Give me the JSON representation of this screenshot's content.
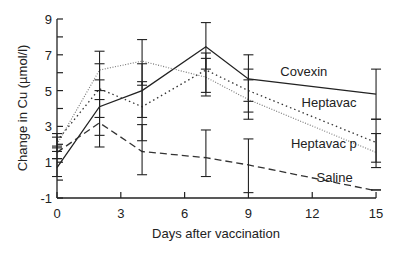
{
  "chart_data": {
    "type": "line",
    "title": "",
    "xlabel": "Days after vaccination",
    "ylabel": "Change in Cu (µmol/l)",
    "xlim": [
      0,
      15
    ],
    "ylim": [
      -1,
      9
    ],
    "xticks": [
      0,
      3,
      6,
      9,
      12,
      15
    ],
    "yticks": [
      -1,
      1,
      3,
      5,
      7,
      9
    ],
    "grid": false,
    "legend": "inline labels",
    "x": [
      0,
      2,
      4,
      7,
      9,
      15
    ],
    "series": [
      {
        "name": "Covexin",
        "style": "solid",
        "values": [
          0.7,
          4.1,
          5.0,
          7.45,
          5.65,
          4.8
        ],
        "err": [
          [
            0.2,
            1.2
          ],
          [
            2.5,
            5.6
          ],
          [
            3.5,
            6.5
          ],
          [
            6.2,
            8.8
          ],
          [
            4.4,
            7.0
          ],
          [
            3.4,
            6.2
          ]
        ],
        "label_pos": [
          10.5,
          5.8
        ]
      },
      {
        "name": "Heptavac",
        "style": "dotted",
        "values": [
          2.2,
          5.1,
          4.1,
          6.15,
          5.0,
          2.1
        ],
        "err": [
          [
            1.8,
            2.6
          ],
          [
            3.5,
            6.5
          ],
          [
            2.2,
            5.5
          ],
          [
            4.9,
            7.1
          ],
          [
            3.8,
            6.2
          ],
          [
            1.0,
            3.4
          ]
        ],
        "label_pos": [
          11.5,
          4.1
        ]
      },
      {
        "name": "Heptavac p",
        "style": "fine-dotted",
        "values": [
          2.0,
          6.15,
          6.65,
          5.75,
          4.5,
          1.55
        ],
        "err": [
          [
            1.6,
            2.4
          ],
          [
            5.0,
            7.2
          ],
          [
            5.3,
            7.85
          ],
          [
            4.7,
            6.8
          ],
          [
            3.4,
            5.6
          ],
          [
            0.7,
            2.6
          ]
        ],
        "label_pos": [
          11.0,
          1.8
        ]
      },
      {
        "name": "Saline",
        "style": "dashed",
        "values": [
          1.55,
          3.2,
          1.6,
          1.25,
          0.85,
          -0.6
        ],
        "err": [
          [
            1.2,
            1.9
          ],
          [
            1.85,
            4.5
          ],
          [
            0.3,
            3.1
          ],
          [
            0.2,
            2.8
          ],
          [
            -0.7,
            2.3
          ],
          [
            -0.55,
            -0.55
          ]
        ],
        "label_pos": [
          12.2,
          -0.1
        ]
      }
    ]
  },
  "axes": {
    "x_title": "Days after vaccination",
    "y_title": "Change in Cu (µmol/l)",
    "x_tick_labels": [
      "0",
      "3",
      "6",
      "9",
      "12",
      "15"
    ],
    "y_tick_labels": [
      "-1",
      "1",
      "3",
      "5",
      "7",
      "9"
    ]
  }
}
